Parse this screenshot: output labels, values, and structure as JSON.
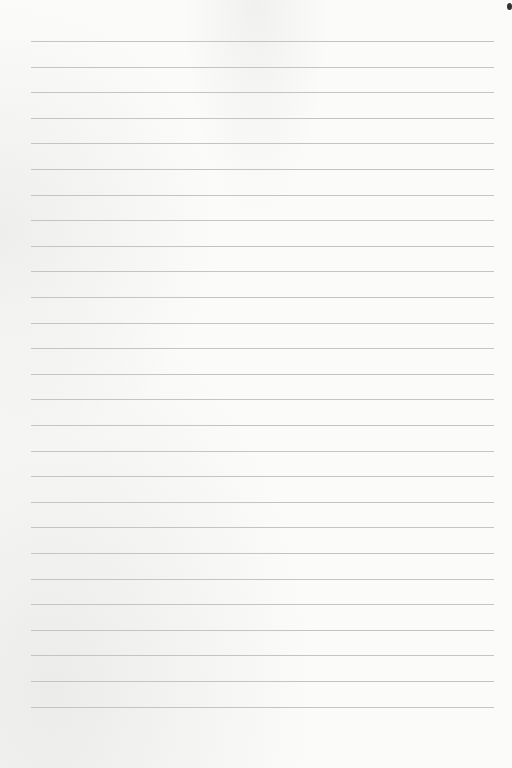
{
  "page": {
    "type": "lined-paper",
    "line_count": 27,
    "first_line_y": 41,
    "line_spacing": 25.6,
    "line_left": 31,
    "line_right": 494,
    "line_color": "#c4c4c2",
    "paper_color": "#fbfbfa"
  }
}
